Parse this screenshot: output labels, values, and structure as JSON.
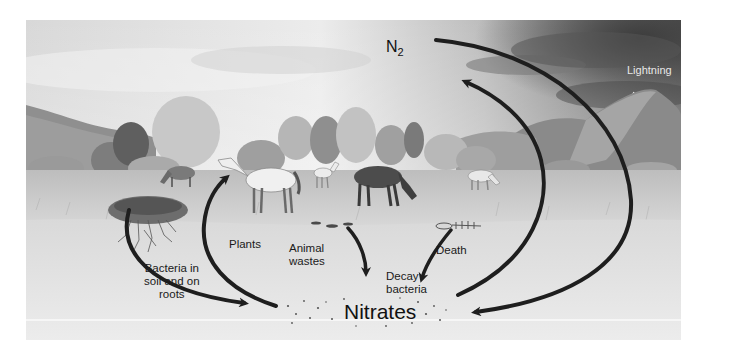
{
  "diagram": {
    "nodes": {
      "atmosphere": "N",
      "atmosphere_subscript": "2",
      "lightning": "Lightning",
      "nitrates": "Nitrates",
      "plants": "Plants",
      "animal_wastes_line1": "Animal",
      "animal_wastes_line2": "wastes",
      "decay_line1": "Decay",
      "decay_line2": "bacteria",
      "death": "Death",
      "bacteria_line1": "Bacteria in",
      "bacteria_line2": "soil and on",
      "bacteria_line3": "roots"
    },
    "edges": [
      {
        "from": "N2",
        "to": "Nitrates",
        "via": "Lightning"
      },
      {
        "from": "Nitrates",
        "to": "N2"
      },
      {
        "from": "Nitrates",
        "to": "Plants"
      },
      {
        "from": "Bacteria in soil and on roots",
        "to": "Nitrates"
      },
      {
        "from": "Animal wastes",
        "to": "Decay bacteria"
      },
      {
        "from": "Death",
        "to": "Decay bacteria"
      }
    ],
    "colors": {
      "arrow": "#1e1e1e",
      "sky": "#e4e4e4",
      "storm": "#5a5a5a",
      "soil": "#e6e6e6",
      "grass": "#c9c9c9"
    }
  }
}
